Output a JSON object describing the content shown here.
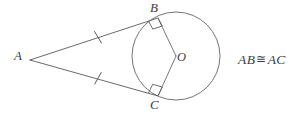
{
  "figure": {
    "type": "geometry-diagram",
    "background_color": "#ffffff",
    "stroke_color": "#5a5a5c",
    "label_color": "#3d3d3f",
    "width": 301,
    "height": 119
  },
  "labels": {
    "vertex_a": "A",
    "vertex_b": "B",
    "vertex_c": "C",
    "center_o": "O"
  },
  "statement": {
    "left_segment": "AB",
    "congruent_symbol": "≅",
    "right_segment": "AC",
    "full_text": "AB ≅ AC"
  },
  "geometry": {
    "circle": {
      "cx": 176,
      "cy": 56,
      "r": 44
    },
    "point_a": {
      "x": 30,
      "y": 60
    },
    "point_b": {
      "x": 158,
      "y": 18
    },
    "point_c": {
      "x": 158,
      "y": 96
    },
    "point_o": {
      "x": 176,
      "y": 56
    },
    "tangent_ab": {
      "x1": 30,
      "y1": 60,
      "x2": 158,
      "y2": 18
    },
    "tangent_ac": {
      "x1": 30,
      "y1": 60,
      "x2": 158,
      "y2": 96
    },
    "radius_ob": {
      "x1": 176,
      "y1": 56,
      "x2": 158,
      "y2": 18
    },
    "radius_oc": {
      "x1": 176,
      "y1": 56,
      "x2": 158,
      "y2": 96
    },
    "tick_ab": {
      "cx": 98,
      "cy": 37
    },
    "tick_ac": {
      "cx": 98,
      "cy": 78
    },
    "right_angle_b": {
      "at": "B",
      "size": 10
    },
    "right_angle_c": {
      "at": "C",
      "size": 10
    }
  }
}
